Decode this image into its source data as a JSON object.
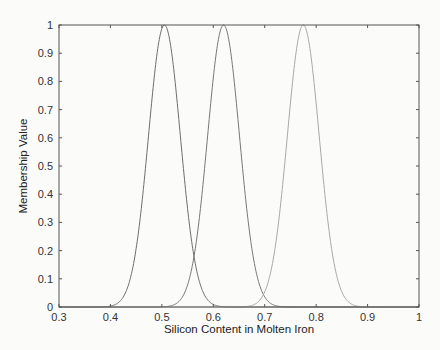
{
  "chart_data": {
    "type": "line",
    "title": "",
    "xlabel": "Silicon Content in Molten Iron",
    "ylabel": "Membership Value",
    "xlim": [
      0.3,
      1.0
    ],
    "ylim": [
      0,
      1
    ],
    "xticks": [
      "0.3",
      "0.4",
      "0.5",
      "0.6",
      "0.7",
      "0.8",
      "0.9",
      "1"
    ],
    "yticks": [
      "0",
      "0.1",
      "0.2",
      "0.3",
      "0.4",
      "0.5",
      "0.6",
      "0.7",
      "0.8",
      "0.9",
      "1"
    ],
    "grid": false,
    "legend": null,
    "series": [
      {
        "name": "MF1 (Gaussian)",
        "center": 0.505,
        "sigma": 0.031,
        "color": "#6e6e6e",
        "x": [
          0.4,
          0.44,
          0.47,
          0.49,
          0.505,
          0.52,
          0.54,
          0.5625,
          0.6,
          0.62
        ],
        "y": [
          0.0,
          0.11,
          0.53,
          0.89,
          1.0,
          0.89,
          0.53,
          0.18,
          0.01,
          0.0
        ]
      },
      {
        "name": "MF2 (Gaussian)",
        "center": 0.62,
        "sigma": 0.031,
        "color": "#777777",
        "x": [
          0.52,
          0.5625,
          0.585,
          0.605,
          0.62,
          0.635,
          0.655,
          0.6975,
          0.72
        ],
        "y": [
          0.0,
          0.18,
          0.53,
          0.89,
          1.0,
          0.89,
          0.53,
          0.04,
          0.0
        ]
      },
      {
        "name": "MF3 (Gaussian)",
        "center": 0.775,
        "sigma": 0.031,
        "color": "#a8a8a8",
        "x": [
          0.67,
          0.6975,
          0.74,
          0.76,
          0.775,
          0.79,
          0.81,
          0.85,
          0.88
        ],
        "y": [
          0.0,
          0.04,
          0.53,
          0.89,
          1.0,
          0.89,
          0.53,
          0.05,
          0.0
        ]
      }
    ]
  }
}
